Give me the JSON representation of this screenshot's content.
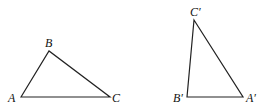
{
  "figure": {
    "triangles": [
      {
        "name": "ABC",
        "vertices": [
          {
            "label": "A",
            "x": 21,
            "y": 97,
            "lx": 8,
            "ly": 102
          },
          {
            "label": "B",
            "x": 49,
            "y": 51,
            "lx": 45,
            "ly": 47
          },
          {
            "label": "C",
            "x": 110,
            "y": 97,
            "lx": 112,
            "ly": 102
          }
        ]
      },
      {
        "name": "A'B'C'",
        "vertices": [
          {
            "label": "A′",
            "x": 243,
            "y": 97,
            "lx": 246,
            "ly": 102
          },
          {
            "label": "B′",
            "x": 187,
            "y": 97,
            "lx": 173,
            "ly": 102
          },
          {
            "label": "C′",
            "x": 194,
            "y": 20,
            "lx": 190,
            "ly": 16
          }
        ]
      }
    ],
    "stroke_color": "#222222"
  }
}
